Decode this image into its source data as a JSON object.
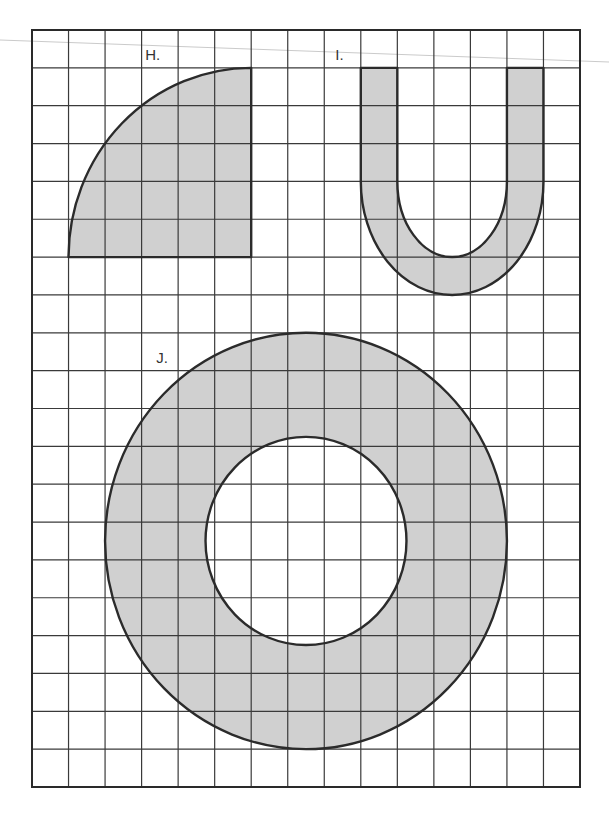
{
  "figure": {
    "width": 609,
    "height": 815,
    "grid": {
      "columns": 15,
      "rows": 20,
      "left": 32,
      "top": 30,
      "right": 580,
      "bottom": 787,
      "line_color": "#3a3a3a",
      "border_color": "#2a2a2a"
    },
    "colors": {
      "shape_fill": "#d0d0d0",
      "shape_stroke": "#2b2b2b",
      "scan_line": "#bdbdbd"
    },
    "shapes": [
      {
        "id": "H",
        "label": "H.",
        "type": "quarter-circle",
        "description": "Quarter circle with center at the bottom-right grid corner, radius 5 grid squares",
        "grid_bounds": {
          "x0": 1,
          "y0": 1,
          "x1": 6,
          "y1": 6
        },
        "label_pos": {
          "col": 3.1,
          "row": 0.8
        }
      },
      {
        "id": "I",
        "label": "I.",
        "type": "u-shape",
        "description": "U-shaped band with arms 1 square wide; outer width 5 squares, inner width 3 squares",
        "grid_bounds": {
          "x0": 9,
          "y0": 1,
          "x1": 14,
          "y1": 7
        },
        "label_pos": {
          "col": 8.3,
          "row": 0.8
        }
      },
      {
        "id": "J",
        "label": "J.",
        "type": "annulus",
        "description": "Ring: outer circle radius 5.5 squares, inner circle radius 2.75 squares, concentric",
        "center": {
          "col": 7.5,
          "row": 13.5
        },
        "outer_radius": 5.5,
        "inner_radius": 2.75,
        "label_pos": {
          "col": 3.4,
          "row": 8.8
        }
      }
    ]
  }
}
